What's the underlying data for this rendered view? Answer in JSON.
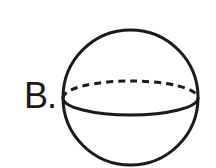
{
  "figure": {
    "label": "B.",
    "shape": "sphere",
    "stroke_color": "#1a1a1a",
    "background": "#ffffff",
    "sphere": {
      "cx": 130.5,
      "cy": 97.5,
      "r": 67.5
    },
    "equator": {
      "cy": 98,
      "rx": 67.5,
      "ry": 17,
      "back": "dashed",
      "front": "solid"
    }
  }
}
